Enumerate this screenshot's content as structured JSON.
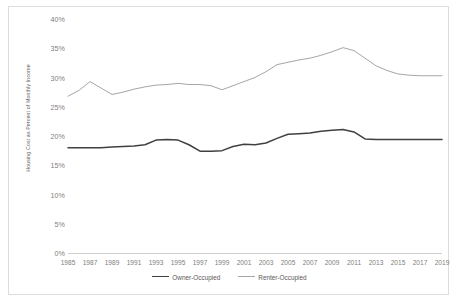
{
  "chart_data": {
    "type": "line",
    "title": "",
    "xlabel": "",
    "ylabel": "Housing Cost as Percent of Monthly Income",
    "ylim": [
      0,
      40
    ],
    "yticks": [
      "0%",
      "5%",
      "10%",
      "15%",
      "20%",
      "25%",
      "30%",
      "35%",
      "40%"
    ],
    "ytick_values": [
      0,
      5,
      10,
      15,
      20,
      25,
      30,
      35,
      40
    ],
    "grid": false,
    "legend_position": "bottom",
    "xlim": [
      1985,
      2019
    ],
    "xticks": [
      "1985",
      "1987",
      "1989",
      "1991",
      "1993",
      "1995",
      "1997",
      "1999",
      "2001",
      "2003",
      "2005",
      "2007",
      "2009",
      "2011",
      "2013",
      "2015",
      "2017",
      "2019"
    ],
    "x": [
      1985,
      1986,
      1987,
      1988,
      1989,
      1990,
      1991,
      1992,
      1993,
      1994,
      1995,
      1996,
      1997,
      1998,
      1999,
      2000,
      2001,
      2002,
      2003,
      2004,
      2005,
      2006,
      2007,
      2008,
      2009,
      2010,
      2011,
      2012,
      2013,
      2014,
      2015,
      2016,
      2017,
      2018,
      2019
    ],
    "series": [
      {
        "name": "Owner-Occupied",
        "color": "#404040",
        "values": [
          18.0,
          18.0,
          18.0,
          18.0,
          18.1,
          18.2,
          18.3,
          18.5,
          19.3,
          19.4,
          19.3,
          18.5,
          17.4,
          17.4,
          17.5,
          18.2,
          18.6,
          18.5,
          18.8,
          19.6,
          20.3,
          20.4,
          20.5,
          20.8,
          21.0,
          21.1,
          20.7,
          19.5,
          19.4,
          19.4,
          19.4,
          19.4,
          19.4,
          19.4,
          19.4
        ]
      },
      {
        "name": "Renter-Occupied",
        "color": "#a6a6a6",
        "values": [
          26.8,
          27.8,
          29.3,
          28.2,
          27.1,
          27.5,
          28.0,
          28.4,
          28.7,
          28.8,
          29.0,
          28.8,
          28.8,
          28.6,
          27.9,
          28.6,
          29.3,
          30.0,
          31.0,
          32.2,
          32.6,
          33.0,
          33.3,
          33.8,
          34.4,
          35.1,
          34.6,
          33.3,
          32.0,
          31.2,
          30.6,
          30.4,
          30.3,
          30.3,
          30.3
        ]
      }
    ]
  },
  "legend": {
    "items": [
      {
        "label": "Owner-Occupied",
        "color": "#404040"
      },
      {
        "label": "Renter-Occupied",
        "color": "#a6a6a6"
      }
    ]
  }
}
